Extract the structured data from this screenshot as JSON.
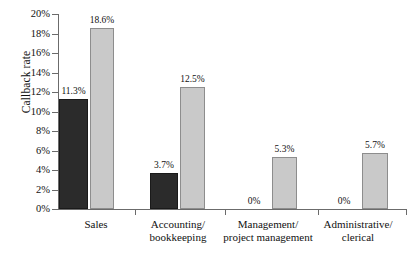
{
  "chart_data": {
    "type": "bar",
    "title": "",
    "xlabel": "",
    "ylabel": "Callback rate",
    "ylim": [
      0,
      20
    ],
    "ytick_labels": [
      "0%",
      "2%",
      "4%",
      "6%",
      "8%",
      "10%",
      "12%",
      "14%",
      "16%",
      "18%",
      "20%"
    ],
    "ytick_values": [
      0,
      2,
      4,
      6,
      8,
      10,
      12,
      14,
      16,
      18,
      20
    ],
    "grid": false,
    "legend": "none",
    "categories": [
      "Sales",
      "Accounting/\nbookkeeping",
      "Management/\nproject management",
      "Administrative/\nclerical"
    ],
    "series": [
      {
        "name": "dark",
        "color": "#2b2b2b",
        "values": [
          11.3,
          3.7,
          0,
          0
        ],
        "labels": [
          "11.3%",
          "3.7%",
          "0%",
          "0%"
        ]
      },
      {
        "name": "light",
        "color": "#c9c9c9",
        "values": [
          18.6,
          12.5,
          5.3,
          5.7
        ],
        "labels": [
          "18.6%",
          "12.5%",
          "5.3%",
          "5.7%"
        ]
      }
    ]
  }
}
